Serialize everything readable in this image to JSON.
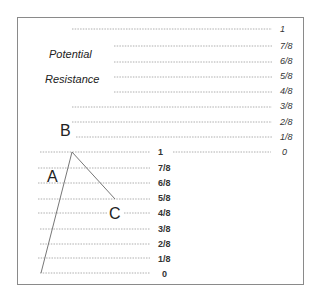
{
  "diagram": {
    "captions": [
      "Potential",
      "Resistance"
    ],
    "point_labels": {
      "A": "A",
      "B": "B",
      "C": "C"
    },
    "upper_scale": {
      "labels": [
        "1",
        "7/8",
        "6/8",
        "5/8",
        "4/8",
        "3/8",
        "2/8",
        "1/8",
        "0"
      ],
      "style": "italic"
    },
    "lower_scale": {
      "labels": [
        "1",
        "7/8",
        "6/8",
        "5/8",
        "4/8",
        "3/8",
        "2/8",
        "1/8",
        "0"
      ],
      "style": "bold"
    },
    "colors": {
      "line": "#777777",
      "dotted": "#9a9a9a",
      "border": "#8a8a8a",
      "text": "#333333"
    }
  }
}
